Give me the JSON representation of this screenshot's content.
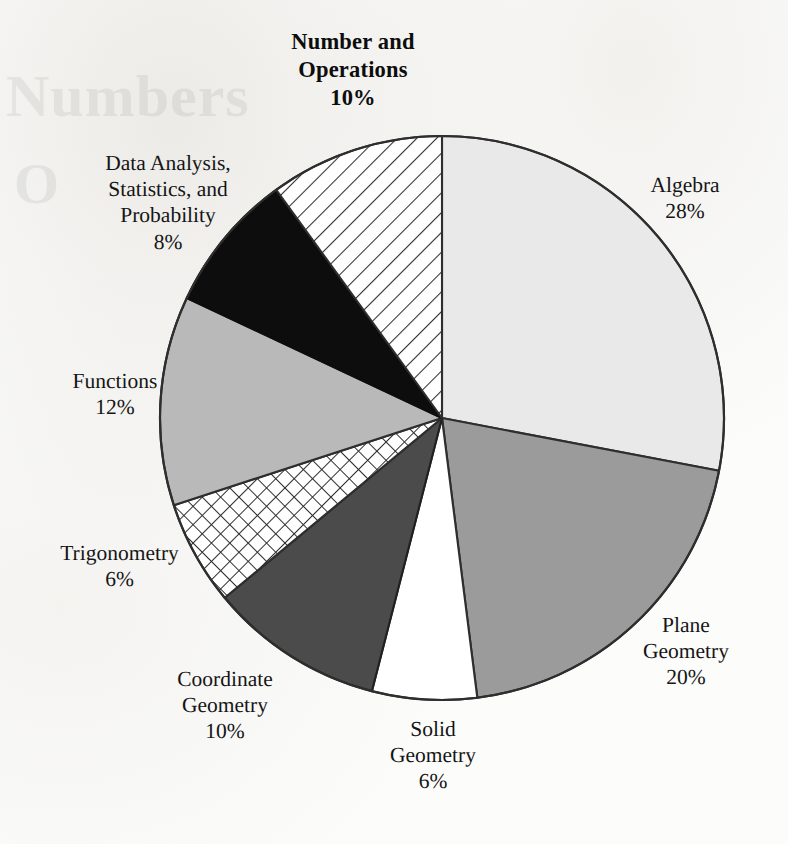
{
  "chart_data": {
    "type": "pie",
    "title": "Number and\nOperations\n10%",
    "title_text": "Number and Operations",
    "subtitle": "",
    "xlabel": "",
    "ylabel": "",
    "legend_position": "outside-labels",
    "grid": false,
    "total": 100,
    "unit": "%",
    "start_angle_deg": 0,
    "direction": "clockwise",
    "categories": [
      "Algebra",
      "Plane Geometry",
      "Solid Geometry",
      "Coordinate Geometry",
      "Trigonometry",
      "Functions",
      "Data Analysis, Statistics, and Probability",
      "Number and Operations"
    ],
    "values": [
      28,
      20,
      6,
      10,
      6,
      12,
      8,
      10
    ],
    "slices": [
      {
        "id": "algebra",
        "label": "Algebra",
        "label_lines": "Algebra",
        "value": 28,
        "percent_text": "28%",
        "fill": "#e9e9e9",
        "pattern": "solid",
        "stroke": "#3a3a3a"
      },
      {
        "id": "plane-geometry",
        "label": "Plane Geometry",
        "label_lines": "Plane\nGeometry",
        "value": 20,
        "percent_text": "20%",
        "fill": "#9b9b9b",
        "pattern": "solid",
        "stroke": "#2e2e2e"
      },
      {
        "id": "solid-geometry",
        "label": "Solid Geometry",
        "label_lines": "Solid\nGeometry",
        "value": 6,
        "percent_text": "6%",
        "fill": "#ffffff",
        "pattern": "solid",
        "stroke": "#2e2e2e"
      },
      {
        "id": "coordinate-geometry",
        "label": "Coordinate Geometry",
        "label_lines": "Coordinate\nGeometry",
        "value": 10,
        "percent_text": "10%",
        "fill": "#4b4b4b",
        "pattern": "solid",
        "stroke": "#202020"
      },
      {
        "id": "trigonometry",
        "label": "Trigonometry",
        "label_lines": "Trigonometry",
        "value": 6,
        "percent_text": "6%",
        "fill": "#ffffff",
        "pattern": "crosshatch",
        "stroke": "#2e2e2e"
      },
      {
        "id": "functions",
        "label": "Functions",
        "label_lines": "Functions",
        "value": 12,
        "percent_text": "12%",
        "fill": "#b9b9b9",
        "pattern": "solid",
        "stroke": "#2e2e2e"
      },
      {
        "id": "data-analysis",
        "label": "Data Analysis, Statistics, and Probability",
        "label_lines": "Data Analysis,\nStatistics, and\nProbability",
        "value": 8,
        "percent_text": "8%",
        "fill": "#0d0d0d",
        "pattern": "solid",
        "stroke": "#0d0d0d"
      },
      {
        "id": "number-operations",
        "label": "Number and Operations",
        "label_lines": "Number and\nOperations",
        "value": 10,
        "percent_text": "10%",
        "fill": "#ffffff",
        "pattern": "diagonal-hatch",
        "stroke": "#2e2e2e"
      }
    ]
  },
  "labels": {
    "title": "Number and\nOperations\n10%",
    "algebra": "Algebra\n28%",
    "plane_geometry": "Plane\nGeometry\n20%",
    "solid_geometry": "Solid\nGeometry\n6%",
    "coordinate_geometry": "Coordinate\nGeometry\n10%",
    "trigonometry": "Trigonometry\n6%",
    "functions": "Functions\n12%",
    "data_analysis": "Data Analysis,\nStatistics, and\nProbability\n8%"
  },
  "watermark": {
    "line1": "Numbers",
    "line2": "O"
  },
  "geometry": {
    "center_x": 442,
    "center_y": 418,
    "radius": 282
  },
  "colors": {
    "page_background": "#fcfcfb",
    "outline": "#2e2e2e",
    "text": "#151515"
  }
}
